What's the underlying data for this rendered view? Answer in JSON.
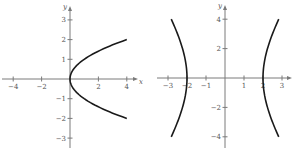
{
  "colors": {
    "axis": "#7a7a7a",
    "curve": "#1a1a1a",
    "label": "#555555",
    "background": "#ffffff"
  },
  "chart_data": [
    {
      "type": "line",
      "title": "",
      "equation": "x = y^2",
      "xlabel": "x",
      "ylabel": "y",
      "xlim": [
        -4.6,
        4.8
      ],
      "ylim": [
        -3.6,
        3.7
      ],
      "grid": false,
      "x_ticks": [
        -4,
        -2,
        2,
        4
      ],
      "x_tick_labels": [
        "−4",
        "−2",
        "2",
        "4"
      ],
      "y_ticks": [
        3,
        2,
        1,
        -1,
        -2,
        -3
      ],
      "y_tick_labels": [
        "3",
        "2",
        "1",
        "−1",
        "−2",
        "−3"
      ],
      "series": [
        {
          "name": "parabola",
          "x": [
            4,
            2.25,
            1,
            0.25,
            0,
            0.25,
            1,
            2.25,
            4
          ],
          "y": [
            2,
            1.5,
            1,
            0.5,
            0,
            -0.5,
            -1,
            -1.5,
            -2
          ]
        }
      ]
    },
    {
      "type": "line",
      "title": "",
      "equation": "x^2/4 - y^2/16 = 1",
      "xlabel": "",
      "ylabel": "y",
      "xlim": [
        -3.6,
        3.5
      ],
      "ylim": [
        -4.8,
        5.0
      ],
      "grid": false,
      "x_ticks": [
        -3,
        -2,
        -1,
        1,
        2,
        3
      ],
      "x_tick_labels": [
        "−3",
        "−2",
        "−1",
        "1",
        "2",
        "3"
      ],
      "y_ticks": [
        4,
        2,
        -2,
        -4
      ],
      "y_tick_labels": [
        "4",
        "2",
        "−2",
        "−4"
      ],
      "series": [
        {
          "name": "left-branch",
          "x": [
            -2.83,
            -2.5,
            -2.24,
            -2.06,
            -2,
            -2.06,
            -2.24,
            -2.5,
            -2.83
          ],
          "y": [
            4,
            3,
            2,
            1,
            0,
            -1,
            -2,
            -3,
            -4
          ]
        },
        {
          "name": "right-branch",
          "x": [
            2.83,
            2.5,
            2.24,
            2.06,
            2,
            2.06,
            2.24,
            2.5,
            2.83
          ],
          "y": [
            4,
            3,
            2,
            1,
            0,
            -1,
            -2,
            -3,
            -4
          ]
        }
      ]
    }
  ],
  "layout": {
    "plots": [
      {
        "origin": [
          70,
          79
        ],
        "xscale": 14.2,
        "yscale": 19.7,
        "x_axis_px": [
          2,
          138
        ],
        "y_axis_px": [
          6,
          148
        ],
        "xlabel_px": [
          139,
          84
        ],
        "ylabel_px": [
          63,
          9
        ]
      },
      {
        "origin": [
          225,
          78
        ],
        "xscale": 19.0,
        "yscale": 14.7,
        "x_axis_px": [
          157,
          292
        ],
        "y_axis_px": [
          5,
          148
        ],
        "xlabel_px": null,
        "ylabel_px": [
          218,
          8
        ]
      }
    ]
  }
}
